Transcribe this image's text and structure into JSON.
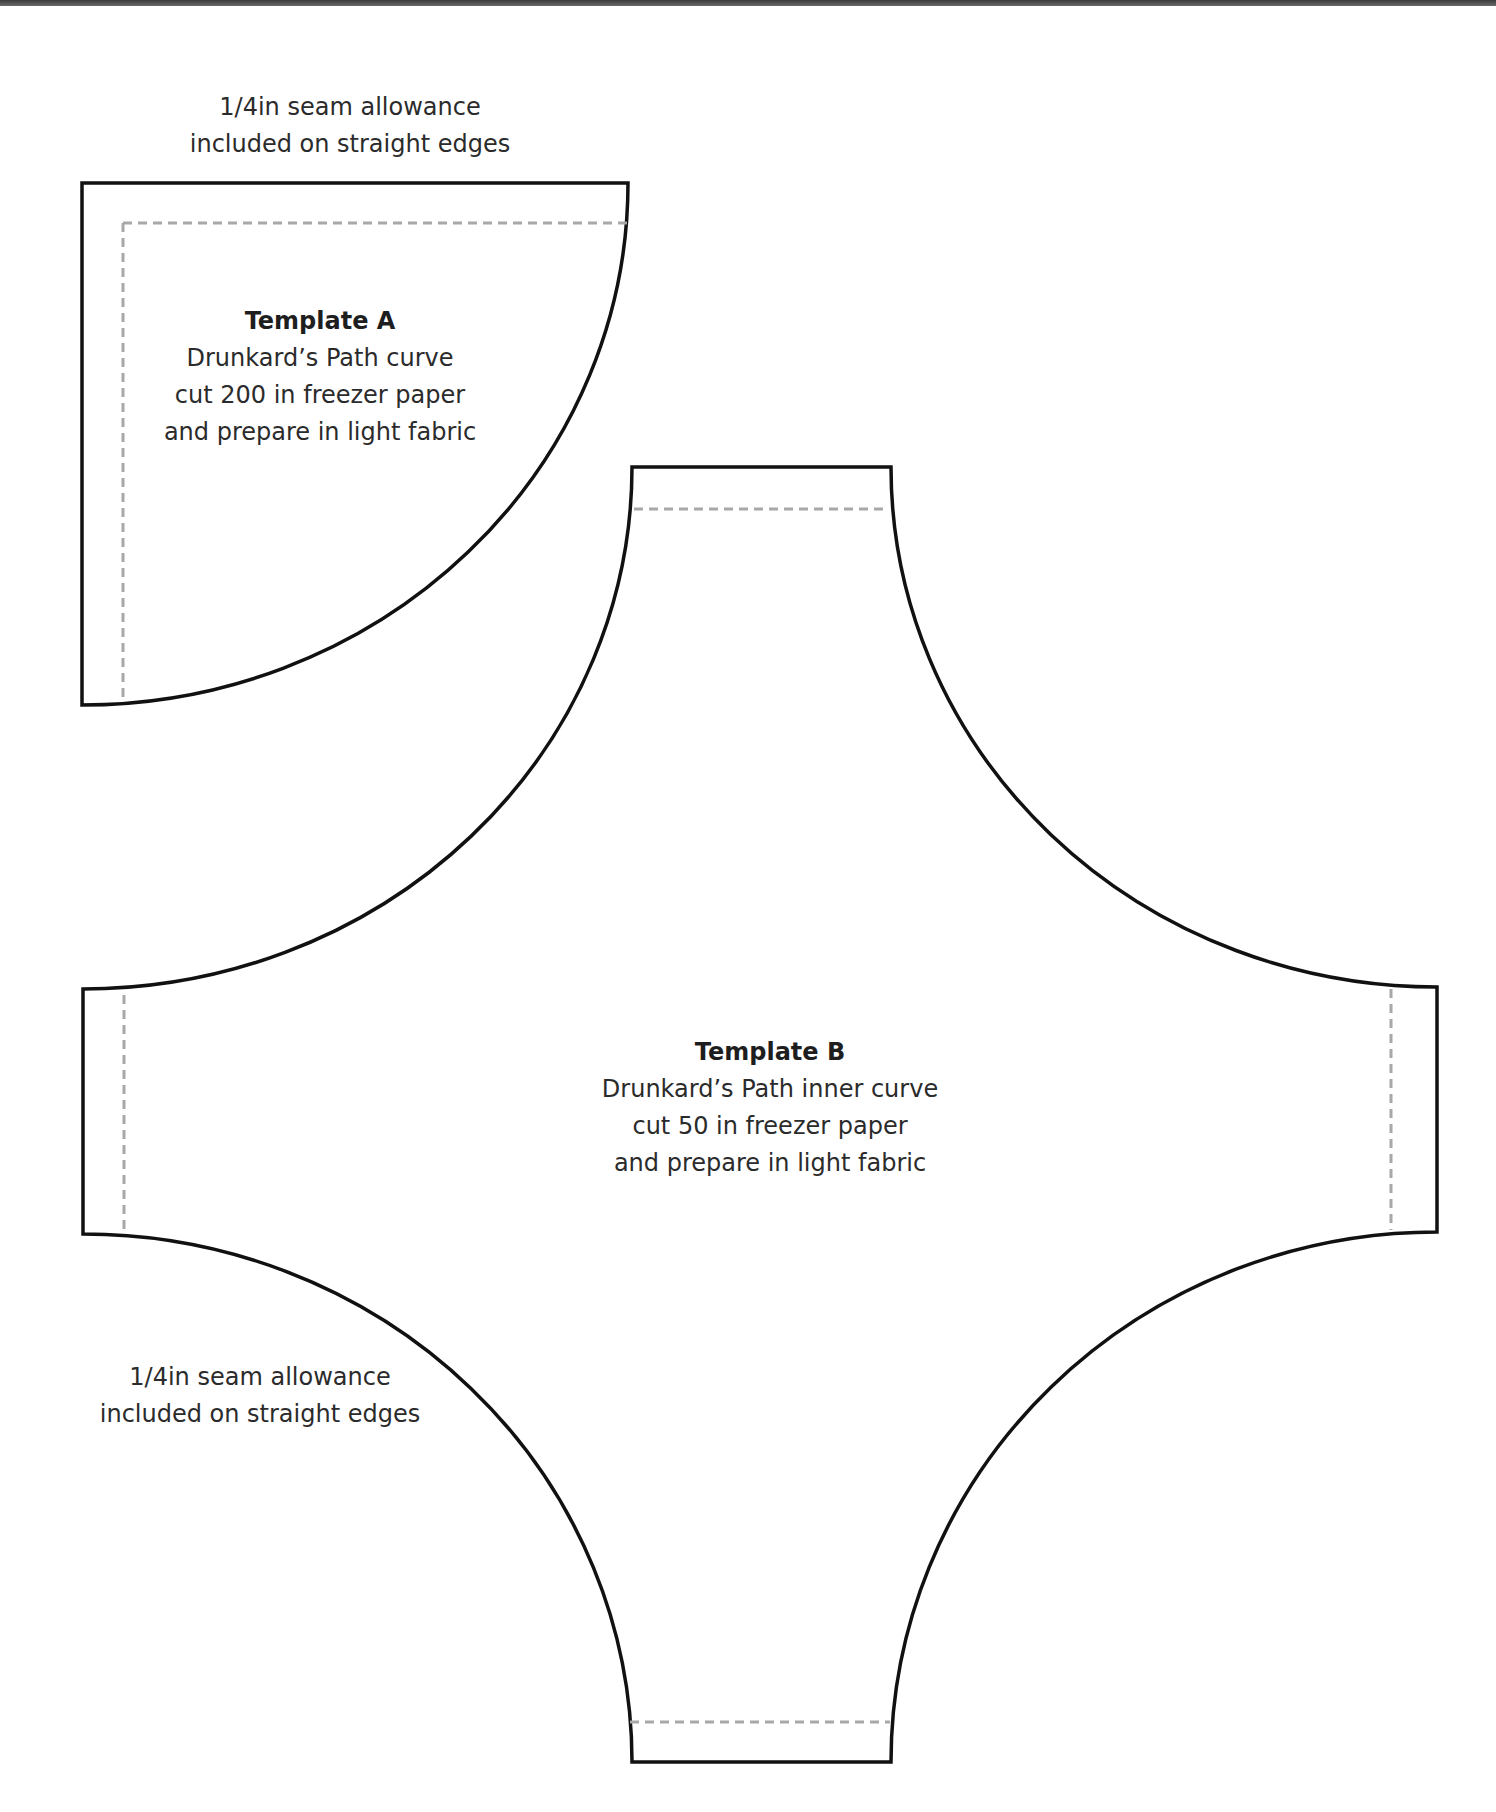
{
  "colors": {
    "outline": "#111111",
    "seam_line": "#a8a8a8",
    "text": "#2b2b2b",
    "background": "#ffffff"
  },
  "seam_notes": {
    "top": {
      "line1": "1/4in seam allowance",
      "line2": "included on straight edges"
    },
    "bottom_left": {
      "line1": "1/4in seam allowance",
      "line2": "included on straight edges"
    }
  },
  "template_a": {
    "title": "Template A",
    "line1": "Drunkard’s Path curve",
    "line2": "cut 200 in freezer paper",
    "line3": "and prepare in light fabric"
  },
  "template_b": {
    "title": "Template B",
    "line1": "Drunkard’s Path inner curve",
    "line2": "cut 50 in freezer paper",
    "line3": "and prepare in light fabric"
  }
}
